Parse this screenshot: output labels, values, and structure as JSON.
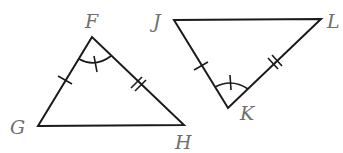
{
  "diagram": {
    "type": "congruent-triangles",
    "triangles": [
      {
        "name": "triangle-FGH",
        "vertices": {
          "F": {
            "label": "F",
            "x": 92,
            "y": 37
          },
          "G": {
            "label": "G",
            "x": 38,
            "y": 126
          },
          "H": {
            "label": "H",
            "x": 184,
            "y": 125
          }
        },
        "marks": {
          "FG": "single-tick",
          "FH": "double-tick",
          "angle_F": "single-arc-with-tick"
        }
      },
      {
        "name": "triangle-JKL",
        "vertices": {
          "J": {
            "label": "J",
            "x": 174,
            "y": 20
          },
          "K": {
            "label": "K",
            "x": 228,
            "y": 108
          },
          "L": {
            "label": "L",
            "x": 321,
            "y": 19
          }
        },
        "marks": {
          "JK": "single-tick",
          "KL": "double-tick",
          "angle_K": "single-arc-with-tick"
        }
      }
    ],
    "labels": {
      "F": "F",
      "G": "G",
      "H": "H",
      "J": "J",
      "K": "K",
      "L": "L"
    },
    "colors": {
      "stroke": "#1a1a1a",
      "label": "#6e6e6e",
      "background": "#ffffff"
    }
  }
}
